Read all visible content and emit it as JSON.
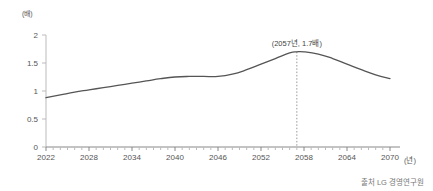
{
  "chart_data": {
    "type": "line",
    "title": "",
    "xlabel": "(년)",
    "ylabel": "(배)",
    "y_unit": "(배)",
    "x_unit": "(년)",
    "xlim": [
      2022,
      2070
    ],
    "ylim": [
      0,
      2
    ],
    "grid": false,
    "legend": null,
    "y_ticks": [
      "0",
      "0.5",
      "1",
      "1.5",
      "2"
    ],
    "y_tick_values": [
      0,
      0.5,
      1,
      1.5,
      2
    ],
    "x_ticks": [
      "2022",
      "2028",
      "2034",
      "2040",
      "2046",
      "2052",
      "2058",
      "2064",
      "2070"
    ],
    "x_tick_values": [
      2022,
      2028,
      2034,
      2040,
      2046,
      2052,
      2058,
      2064,
      2070
    ],
    "line_color": "#555555",
    "series": [
      {
        "name": "배율",
        "x": [
          2022,
          2024,
          2026,
          2028,
          2030,
          2032,
          2034,
          2036,
          2038,
          2040,
          2042,
          2044,
          2046,
          2048,
          2050,
          2052,
          2054,
          2056,
          2057,
          2058,
          2060,
          2062,
          2064,
          2066,
          2068,
          2070
        ],
        "values": [
          0.88,
          0.93,
          0.98,
          1.02,
          1.06,
          1.1,
          1.14,
          1.18,
          1.22,
          1.25,
          1.26,
          1.26,
          1.26,
          1.3,
          1.38,
          1.48,
          1.58,
          1.68,
          1.7,
          1.7,
          1.66,
          1.58,
          1.48,
          1.38,
          1.29,
          1.22
        ]
      }
    ],
    "annotations": [
      {
        "text": "(2057년, 1.7배)",
        "x": 2057,
        "y": 1.7,
        "marker": "dotted-vertical-line"
      }
    ]
  },
  "source": {
    "text": "출처 LG 경영연구원"
  }
}
